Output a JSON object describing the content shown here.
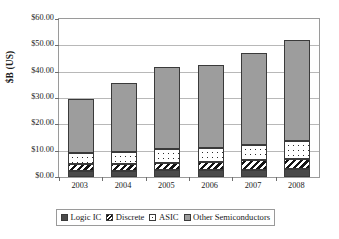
{
  "chart_data": {
    "type": "bar",
    "subtype": "stacked-bar",
    "title": "",
    "xlabel": "",
    "ylabel": "$B (US)",
    "categories": [
      "2003",
      "2004",
      "2005",
      "2006",
      "2007",
      "2008"
    ],
    "ylim": [
      0,
      60
    ],
    "ytick_values": [
      0,
      10,
      20,
      30,
      40,
      50,
      60
    ],
    "ytick_labels": [
      "$0.00",
      "$10.00",
      "$20.00",
      "$30.00",
      "$40.00",
      "$50.00",
      "$60.00"
    ],
    "ytick_prefix": "$",
    "grid": true,
    "legend_position": "bottom",
    "stack_order_bottom_to_top": [
      "Logic IC",
      "Discrete",
      "ASIC",
      "Other Semiconductors"
    ],
    "series": [
      {
        "name": "Logic IC",
        "pattern": "solid-dark",
        "color": "#4a4a4a",
        "values": [
          2.2,
          2.3,
          2.5,
          2.6,
          2.8,
          3.0
        ]
      },
      {
        "name": "Discrete",
        "pattern": "diagonal-stripes",
        "color": "#141414",
        "values": [
          2.6,
          2.7,
          3.0,
          3.2,
          3.5,
          3.8
        ]
      },
      {
        "name": "ASIC",
        "pattern": "dotted-white",
        "color": "#ffffff",
        "values": [
          4.2,
          4.5,
          5.0,
          5.4,
          6.0,
          6.7
        ]
      },
      {
        "name": "Other Semiconductors",
        "pattern": "solid-gray",
        "color": "#9d9d9d",
        "values": [
          20.8,
          26.3,
          31.1,
          31.4,
          34.8,
          38.7
        ]
      }
    ],
    "totals": [
      29.8,
      35.8,
      41.6,
      42.6,
      47.1,
      52.2
    ]
  },
  "legend": {
    "entries": [
      {
        "label": "Logic IC"
      },
      {
        "label": "Discrete"
      },
      {
        "label": "ASIC"
      },
      {
        "label": "Other Semiconductors"
      }
    ]
  }
}
